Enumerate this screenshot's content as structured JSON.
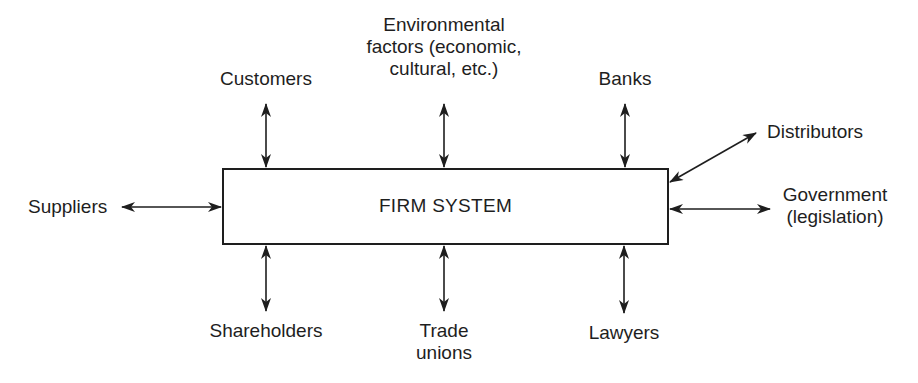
{
  "diagram": {
    "central_box": {
      "label": "FIRM SYSTEM"
    },
    "nodes": {
      "customers": {
        "label": "Customers",
        "position": "top"
      },
      "environmental": {
        "lines": [
          "Environmental",
          "factors (economic,",
          "cultural, etc.)"
        ],
        "position": "top"
      },
      "banks": {
        "label": "Banks",
        "position": "top"
      },
      "distributors": {
        "label": "Distributors",
        "position": "right-upper"
      },
      "government": {
        "lines": [
          "Government",
          "(legislation)"
        ],
        "position": "right"
      },
      "suppliers": {
        "label": "Suppliers",
        "position": "left"
      },
      "shareholders": {
        "label": "Shareholders",
        "position": "bottom"
      },
      "trade_unions": {
        "lines": [
          "Trade",
          "unions"
        ],
        "position": "bottom"
      },
      "lawyers": {
        "label": "Lawyers",
        "position": "bottom"
      }
    },
    "connections": [
      {
        "from": "FIRM SYSTEM",
        "to": "Customers",
        "type": "bidirectional"
      },
      {
        "from": "FIRM SYSTEM",
        "to": "Environmental factors (economic, cultural, etc.)",
        "type": "bidirectional"
      },
      {
        "from": "FIRM SYSTEM",
        "to": "Banks",
        "type": "bidirectional"
      },
      {
        "from": "FIRM SYSTEM",
        "to": "Distributors",
        "type": "bidirectional"
      },
      {
        "from": "FIRM SYSTEM",
        "to": "Government (legislation)",
        "type": "bidirectional"
      },
      {
        "from": "FIRM SYSTEM",
        "to": "Suppliers",
        "type": "bidirectional"
      },
      {
        "from": "FIRM SYSTEM",
        "to": "Shareholders",
        "type": "bidirectional"
      },
      {
        "from": "FIRM SYSTEM",
        "to": "Trade unions",
        "type": "bidirectional"
      },
      {
        "from": "FIRM SYSTEM",
        "to": "Lawyers",
        "type": "bidirectional"
      }
    ],
    "colors": {
      "ink": "#1e1e1e",
      "background": "#ffffff"
    }
  }
}
